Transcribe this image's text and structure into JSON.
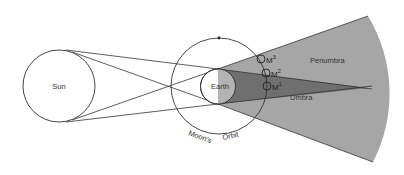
{
  "diagram": {
    "labels": {
      "sun": "Sun",
      "earth": "Earth",
      "penumbra": "Penumbra",
      "umbra": "Umbra",
      "moons_orbit_word1": "Moon's",
      "moons_orbit_word2": "Orbit"
    },
    "moon_positions": [
      {
        "label": "M",
        "sup": "3"
      },
      {
        "label": "M",
        "sup": "2"
      },
      {
        "label": "M",
        "sup": "1"
      }
    ],
    "colors": {
      "background": "#ffffff",
      "line": "#333333",
      "penumbra_fill": "#a6a6a6",
      "umbra_fill": "#6f6f6f",
      "earth_night": "#b3b3b3"
    }
  }
}
